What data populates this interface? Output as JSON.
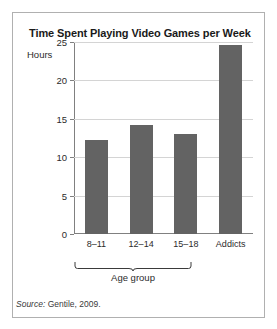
{
  "figure": {
    "title": "Time Spent Playing Video Games per Week",
    "source_prefix": "Source:",
    "source_text": " Gentile, 2009.",
    "group_bracket_label": "Age group",
    "frame_color": "#b0b0b0",
    "bar_color": "#636363",
    "grid_color": "#d4d4d4",
    "axis_color": "#808080",
    "background": "#ffffff"
  },
  "chart_data": {
    "type": "bar",
    "title": "Time Spent Playing Video Games per Week",
    "xlabel": "",
    "ylabel": "Hours",
    "categories": [
      "8–11",
      "12–14",
      "15–18",
      "Addicts"
    ],
    "values": [
      12.3,
      14.2,
      13.0,
      24.6
    ],
    "ylim": [
      0,
      25
    ],
    "yticks": [
      0,
      5,
      10,
      15,
      20,
      25
    ],
    "ytick_labels": [
      "0",
      "5",
      "10",
      "15",
      "20",
      "25"
    ],
    "grid": true,
    "grid_axis": "y",
    "legend": false,
    "annotations": [
      {
        "text": "Age group",
        "covers": [
          "8–11",
          "12–14",
          "15–18"
        ],
        "style": "brace"
      }
    ],
    "source": "Source: Gentile, 2009."
  }
}
